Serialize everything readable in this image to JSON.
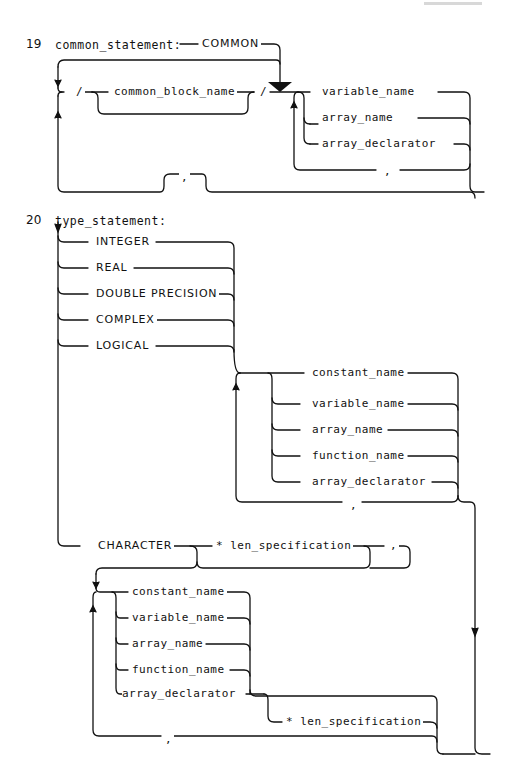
{
  "page_header": {
    "visible": "faint, illegible running header at top right"
  },
  "rule19": {
    "number": "19",
    "title": "common_statement:",
    "keyword": "COMMON",
    "slash_open": "/",
    "slash_close": "/",
    "block_name": "common_block_name",
    "items": [
      "variable_name",
      "array_name",
      "array_declarator"
    ],
    "item_separator": ",",
    "block_separator": ","
  },
  "rule20": {
    "number": "20",
    "title": "type_statement:",
    "types": [
      "INTEGER",
      "REAL",
      "DOUBLE PRECISION",
      "COMPLEX",
      "LOGICAL"
    ],
    "entities": [
      "constant_name",
      "variable_name",
      "array_name",
      "function_name",
      "array_declarator"
    ],
    "entity_separator": ",",
    "character_keyword": "CHARACTER",
    "len_spec": "* len_specification",
    "len_comma": ",",
    "char_entities": [
      "constant_name",
      "variable_name",
      "array_name",
      "function_name",
      "array_declarator"
    ],
    "char_len_spec": "* len_specification",
    "char_separator": ","
  }
}
